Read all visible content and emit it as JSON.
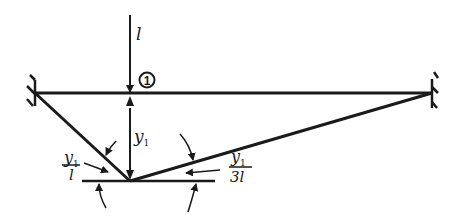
{
  "diagram": {
    "type": "influence-line",
    "colors": {
      "ink": "#1a1a1a",
      "background": "#ffffff"
    },
    "labels": {
      "load": "l",
      "node_marker": "1",
      "deflection": "y",
      "deflection_sub": "1",
      "left_slope_num": "y",
      "left_slope_num_sub": "1",
      "left_slope_den": "l",
      "right_slope_num": "y",
      "right_slope_num_sub": "1",
      "right_slope_den": "3l"
    },
    "supports": [
      {
        "name": "left-fixed-support",
        "x": 35,
        "y": 93
      },
      {
        "name": "right-fixed-support",
        "x": 432,
        "y": 93
      }
    ],
    "beam": {
      "x1": 35,
      "x2": 432,
      "y": 93
    },
    "apex": {
      "x": 130,
      "y": 181
    }
  }
}
